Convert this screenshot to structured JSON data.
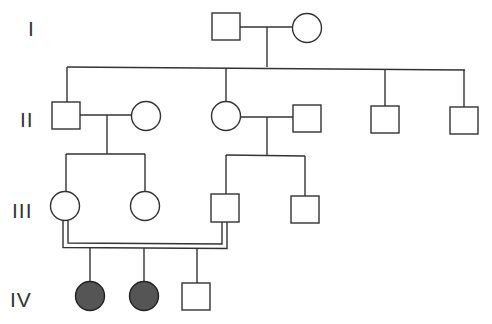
{
  "colors": {
    "line": "#333333",
    "affected_fill": "#555555",
    "unaffected_fill": "#ffffff"
  },
  "generations": [
    {
      "label": "I",
      "y": 30
    },
    {
      "label": "II",
      "y": 121
    },
    {
      "label": "III",
      "y": 212
    },
    {
      "label": "IV",
      "y": 301
    }
  ],
  "individuals": [
    {
      "id": "I-1",
      "generation": "I",
      "sex": "male",
      "affected": false
    },
    {
      "id": "I-2",
      "generation": "I",
      "sex": "female",
      "affected": false
    },
    {
      "id": "II-1",
      "generation": "II",
      "sex": "male",
      "affected": false
    },
    {
      "id": "II-2",
      "generation": "II",
      "sex": "female",
      "affected": false,
      "note": "married in"
    },
    {
      "id": "II-3",
      "generation": "II",
      "sex": "female",
      "affected": false
    },
    {
      "id": "II-4",
      "generation": "II",
      "sex": "male",
      "affected": false,
      "note": "married in"
    },
    {
      "id": "II-5",
      "generation": "II",
      "sex": "male",
      "affected": false
    },
    {
      "id": "II-6",
      "generation": "II",
      "sex": "male",
      "affected": false
    },
    {
      "id": "III-1",
      "generation": "III",
      "sex": "female",
      "affected": false
    },
    {
      "id": "III-2",
      "generation": "III",
      "sex": "female",
      "affected": false
    },
    {
      "id": "III-3",
      "generation": "III",
      "sex": "male",
      "affected": false
    },
    {
      "id": "III-4",
      "generation": "III",
      "sex": "male",
      "affected": false
    },
    {
      "id": "IV-1",
      "generation": "IV",
      "sex": "female",
      "affected": true
    },
    {
      "id": "IV-2",
      "generation": "IV",
      "sex": "female",
      "affected": true
    },
    {
      "id": "IV-3",
      "generation": "IV",
      "sex": "male",
      "affected": false
    }
  ],
  "unions": [
    {
      "partners": [
        "I-1",
        "I-2"
      ],
      "consanguineous": false,
      "children": [
        "II-1",
        "II-3",
        "II-5",
        "II-6"
      ]
    },
    {
      "partners": [
        "II-1",
        "II-2"
      ],
      "consanguineous": false,
      "children": [
        "III-1",
        "III-2"
      ]
    },
    {
      "partners": [
        "II-3",
        "II-4"
      ],
      "consanguineous": false,
      "children": [
        "III-3",
        "III-4"
      ]
    },
    {
      "partners": [
        "III-1",
        "III-3"
      ],
      "consanguineous": true,
      "children": [
        "IV-1",
        "IV-2",
        "IV-3"
      ]
    }
  ]
}
